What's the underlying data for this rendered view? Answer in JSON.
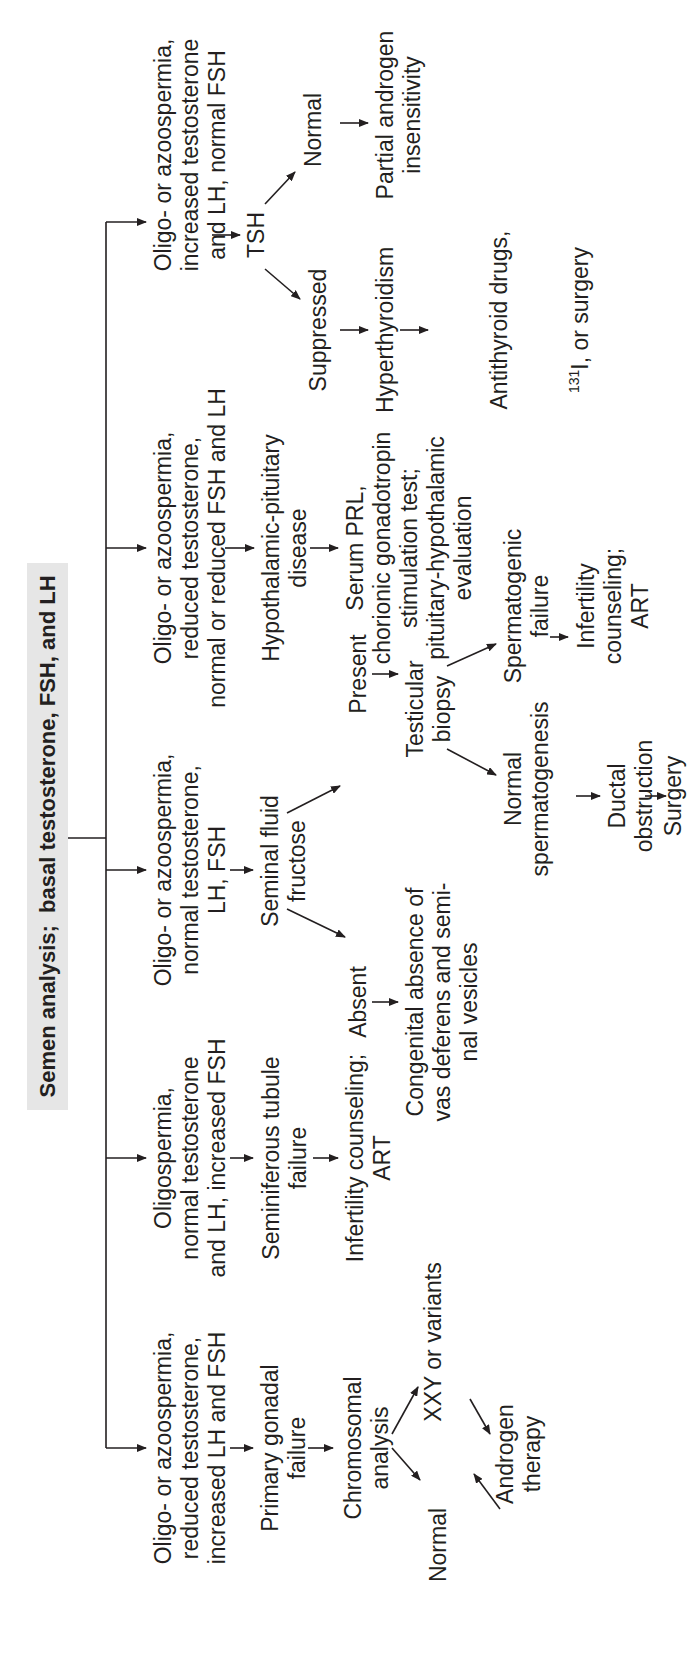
{
  "title": "Semen analysis;  basal testosterone, FSH, and LH",
  "colors": {
    "line": "#231f20",
    "title_bg": "#e6e6e6",
    "background": "#ffffff"
  },
  "branches": [
    {
      "id": "primary-gonadal",
      "condition": "Oligo- or azoospermia,\nreduced testosterone,\nincreased LH and FSH",
      "diagnosis": "Primary gonadal\nfailure",
      "test": "Chromosomal\nanalysis",
      "results": [
        "XXY or variants",
        "Normal"
      ],
      "treatment": "Androgen\ntherapy"
    },
    {
      "id": "seminiferous",
      "condition": "Oligospermia,\nnormal testosterone\nand LH, increased FSH",
      "diagnosis": "Seminiferous tubule\nfailure",
      "treatment": "Infertility counseling;\nART"
    },
    {
      "id": "seminal-fructose",
      "condition": "Oligo- or azoospermia,\nnormal testosterone,\nLH, FSH",
      "test": "Seminal fluid\nfructose",
      "absent": "Absent",
      "absent_result": "Congenital absence of\nvas deferens and semi-\nnal vesicles",
      "present": "Present",
      "biopsy": "Testicular\nbiopsy",
      "spermatogenic_failure": "Spermatogenic\nfailure",
      "spermatogenic_treatment": "Infertility\ncounseling;\nART",
      "normal_spermatogenesis": "Normal\nspermatogenesis",
      "ductal": "Ductal\nobstruction",
      "surgery": "Surgery"
    },
    {
      "id": "hypothalamic",
      "condition": "Oligo- or azoospermia,\nreduced testosterone,\nnormal or reduced FSH and LH",
      "diagnosis": "Hypothalamic-pituitary\ndisease",
      "workup": "Serum PRL,\nchorionic gonadotropin\nstimulation test;\npituitary-hypothalamic\nevaluation"
    },
    {
      "id": "tsh",
      "condition": "Oligo- or azoospermia,\nincreased testosterone\nand LH, normal FSH",
      "test": "TSH",
      "normal": "Normal",
      "normal_result": "Partial androgen\ninsensitivity",
      "suppressed": "Suppressed",
      "suppressed_result": "Hyperthyroidism",
      "treatment_line1": "Antithyroid drugs,",
      "treatment_sup": "131",
      "treatment_line2": "I, or surgery"
    }
  ]
}
